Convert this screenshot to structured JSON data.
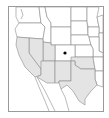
{
  "map": {
    "region": "Western United States",
    "highlight_color": "#e4e4e4",
    "border_color": "#8c8c8c",
    "highlighted_states": [
      "California",
      "Nevada",
      "Utah",
      "Arizona",
      "New Mexico",
      "Texas",
      "Oklahoma"
    ],
    "marked_state": "Colorado",
    "marker": {
      "shape": "dot",
      "color": "#000000"
    }
  }
}
